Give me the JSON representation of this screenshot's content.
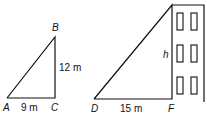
{
  "diagram": {
    "triangle_small": {
      "vertices": {
        "A": "A",
        "B": "B",
        "C": "C"
      },
      "sides": {
        "AC": "9 m",
        "BC": "12 m"
      }
    },
    "triangle_large": {
      "vertices": {
        "D": "D",
        "F": "F"
      },
      "sides": {
        "DF": "15 m",
        "height": "h"
      }
    },
    "building": {
      "window_rows": 3,
      "window_columns": 2
    }
  }
}
